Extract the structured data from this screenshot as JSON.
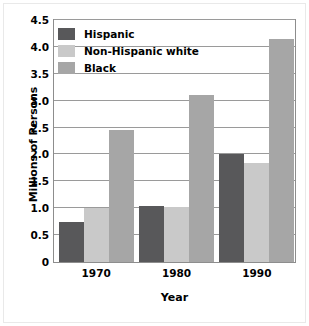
{
  "chart_data": {
    "type": "bar",
    "title": "",
    "xlabel": "Year",
    "ylabel": "Millions of Persons",
    "categories": [
      "1970",
      "1980",
      "1990"
    ],
    "series": [
      {
        "name": "Hispanic",
        "values": [
          0.74,
          1.05,
          2.01
        ],
        "color": "#58585a"
      },
      {
        "name": "Non-Hispanic white",
        "values": [
          1.01,
          1.02,
          1.85
        ],
        "color": "#c9c9c9"
      },
      {
        "name": "Black",
        "values": [
          2.45,
          3.1,
          4.15
        ],
        "color": "#a6a6a6"
      }
    ],
    "ylim": [
      0,
      4.5
    ],
    "y_ticks": [
      "0",
      "0.5",
      "1.0",
      "1.5",
      "2.0",
      "2.5",
      "3.0",
      "3.5",
      "4.0",
      "4.5"
    ],
    "y_tick_values": [
      0,
      0.5,
      1.0,
      1.5,
      2.0,
      2.5,
      3.0,
      3.5,
      4.0,
      4.5
    ],
    "grid": true,
    "legend_position": "top-left"
  },
  "colors": {
    "axis": "#8d8d8d",
    "gridline": "#9a9a9a",
    "text": "#000000",
    "background": "#ffffff"
  }
}
